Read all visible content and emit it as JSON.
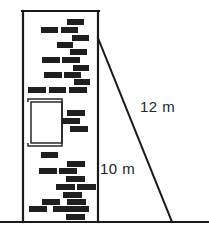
{
  "figure": {
    "type": "geometry-diagram",
    "background_color": "#ffffff",
    "ink_color": "#1a1a1a",
    "brick_color": "#1f1f1f",
    "label_color": "#262626"
  },
  "labels": {
    "hypotenuse": "12 m",
    "wall_height": "10 m"
  },
  "measurements": {
    "ladder_length_m": 12,
    "wall_height_m": 10
  },
  "geometry": {
    "ground_line": {
      "x1": 0,
      "y1": 222,
      "x2": 209,
      "y2": 222,
      "stroke_width": 2.2
    },
    "wall_left_edge": {
      "x1": 23,
      "y1": 11,
      "x2": 23,
      "y2": 222,
      "stroke_width": 2.2
    },
    "wall_top_edge": {
      "x1": 22,
      "y1": 11,
      "x2": 99,
      "y2": 11,
      "stroke_width": 2.2
    },
    "wall_right_edge": {
      "x1": 98,
      "y1": 11,
      "x2": 98,
      "y2": 222,
      "stroke_width": 2.2
    },
    "ladder": {
      "x1": 98,
      "y1": 38,
      "x2": 172,
      "y2": 222,
      "stroke_width": 2.0
    },
    "recess_outline_outer": {
      "x": 28,
      "y": 99,
      "width": 34,
      "height": 47,
      "stroke_width": 1.4
    },
    "recess_outline_inner": {
      "x": 31,
      "y": 102,
      "width": 31,
      "height": 41,
      "stroke_width": 1.4
    }
  },
  "bricks": [
    {
      "x": 67,
      "y": 19,
      "w": 17,
      "h": 6
    },
    {
      "x": 41,
      "y": 27,
      "w": 17,
      "h": 6
    },
    {
      "x": 61,
      "y": 27,
      "w": 17,
      "h": 6
    },
    {
      "x": 72,
      "y": 35,
      "w": 17,
      "h": 6
    },
    {
      "x": 57,
      "y": 42,
      "w": 16,
      "h": 6
    },
    {
      "x": 70,
      "y": 49,
      "w": 17,
      "h": 6
    },
    {
      "x": 42,
      "y": 57,
      "w": 18,
      "h": 6
    },
    {
      "x": 62,
      "y": 57,
      "w": 18,
      "h": 6
    },
    {
      "x": 73,
      "y": 65,
      "w": 16,
      "h": 6
    },
    {
      "x": 44,
      "y": 72,
      "w": 18,
      "h": 6
    },
    {
      "x": 64,
      "y": 72,
      "w": 17,
      "h": 6
    },
    {
      "x": 74,
      "y": 79,
      "w": 16,
      "h": 6
    },
    {
      "x": 28,
      "y": 87,
      "w": 18,
      "h": 6
    },
    {
      "x": 49,
      "y": 87,
      "w": 17,
      "h": 6
    },
    {
      "x": 69,
      "y": 87,
      "w": 18,
      "h": 6
    },
    {
      "x": 67,
      "y": 110,
      "w": 18,
      "h": 6
    },
    {
      "x": 62,
      "y": 118,
      "w": 18,
      "h": 6
    },
    {
      "x": 70,
      "y": 126,
      "w": 18,
      "h": 6
    },
    {
      "x": 41,
      "y": 152,
      "w": 17,
      "h": 6
    },
    {
      "x": 67,
      "y": 161,
      "w": 18,
      "h": 6
    },
    {
      "x": 39,
      "y": 168,
      "w": 18,
      "h": 6
    },
    {
      "x": 59,
      "y": 168,
      "w": 18,
      "h": 6
    },
    {
      "x": 66,
      "y": 176,
      "w": 19,
      "h": 6
    },
    {
      "x": 56,
      "y": 184,
      "w": 19,
      "h": 6
    },
    {
      "x": 77,
      "y": 184,
      "w": 19,
      "h": 6
    },
    {
      "x": 63,
      "y": 192,
      "w": 19,
      "h": 6
    },
    {
      "x": 42,
      "y": 199,
      "w": 18,
      "h": 6
    },
    {
      "x": 67,
      "y": 199,
      "w": 19,
      "h": 6
    },
    {
      "x": 29,
      "y": 206,
      "w": 18,
      "h": 6
    },
    {
      "x": 53,
      "y": 206,
      "w": 18,
      "h": 6
    },
    {
      "x": 71,
      "y": 206,
      "w": 18,
      "h": 6
    },
    {
      "x": 66,
      "y": 214,
      "w": 19,
      "h": 6
    }
  ]
}
